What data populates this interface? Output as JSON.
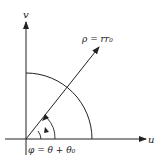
{
  "diagram": {
    "axes": {
      "horizontal_label": "u",
      "vertical_label": "v"
    },
    "ray": {
      "label": "ρ = rr₀"
    },
    "angle": {
      "label": "φ = θ + θ₀"
    },
    "colors": {
      "stroke": "#222222",
      "background": "#ffffff"
    }
  }
}
